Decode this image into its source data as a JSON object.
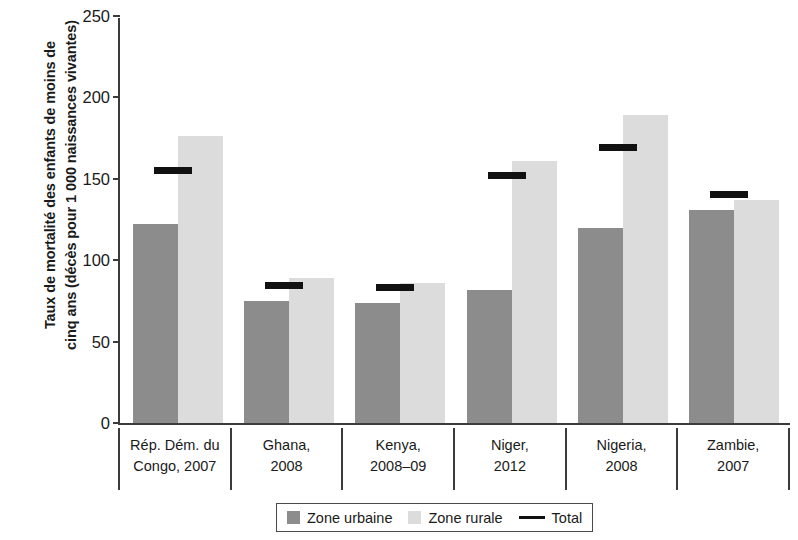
{
  "chart_data": {
    "type": "bar",
    "title": "",
    "subtitle": "",
    "xlabel": "",
    "ylabel_lines": [
      "Taux de mortalité des enfants de moins de",
      "cinq ans (décès pour 1 000 naissances vivantes)"
    ],
    "ylabel": "Taux de mortalité des enfants de moins de cinq ans (décès pour 1 000 naissances vivantes)",
    "ylim": [
      0,
      250
    ],
    "ytick_labels": [
      "250",
      "200",
      "150",
      "100",
      "50",
      "0"
    ],
    "ytick_values": [
      250,
      200,
      150,
      100,
      50,
      0
    ],
    "grid": false,
    "legend_position": "bottom-center",
    "categories": [
      "Rép. Dém. du Congo, 2007",
      "Ghana, 2008",
      "Kenya, 2008–09",
      "Niger, 2012",
      "Nigeria, 2008",
      "Zambie, 2007"
    ],
    "category_lines": [
      [
        "Rép. Dém. du",
        "Congo, 2007"
      ],
      [
        "Ghana,",
        "2008"
      ],
      [
        "Kenya,",
        "2008–09"
      ],
      [
        "Niger,",
        "2012"
      ],
      [
        "Nigeria,",
        "2008"
      ],
      [
        "Zambie,",
        "2007"
      ]
    ],
    "series": [
      {
        "name": "Zone urbaine",
        "color": "#8c8c8c",
        "type": "bar",
        "values": [
          122,
          75,
          74,
          82,
          120,
          131
        ]
      },
      {
        "name": "Zone rurale",
        "color": "#dcdcdc",
        "type": "bar",
        "values": [
          176,
          89,
          86,
          161,
          189,
          137
        ]
      },
      {
        "name": "Total",
        "color": "#111111",
        "type": "marker-line",
        "values": [
          155,
          84,
          83,
          152,
          169,
          140
        ]
      }
    ]
  },
  "legend": {
    "items": [
      {
        "label": "Zone urbaine",
        "marker": "square-dark-gray"
      },
      {
        "label": "Zone rurale",
        "marker": "square-light-gray"
      },
      {
        "label": "Total",
        "marker": "horizontal-line-black"
      }
    ]
  },
  "colors": {
    "urban": "#8c8c8c",
    "rural": "#dcdcdc",
    "total": "#111111",
    "axis": "#3b3b3b",
    "background": "#ffffff"
  }
}
